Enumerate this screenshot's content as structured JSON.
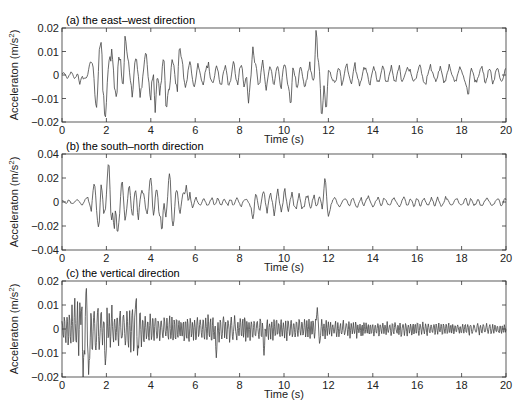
{
  "figure": {
    "width": 525,
    "height": 414,
    "line_color": "#444444",
    "axis_color": "#333333"
  },
  "chart_data": [
    {
      "type": "line",
      "title": "(a) the east–west direction",
      "xlabel": "Time (s)",
      "ylabel": "Acceleraton (m/s²)",
      "xlim": [
        0,
        20
      ],
      "ylim": [
        -0.02,
        0.02
      ],
      "xticks": [
        0,
        2,
        4,
        6,
        8,
        10,
        12,
        14,
        16,
        18,
        20
      ],
      "yticks": [
        -0.02,
        -0.01,
        0,
        0.01,
        0.02
      ],
      "ytick_labels": [
        "-0.02",
        "-0.01",
        "0",
        "0.01",
        "0.02"
      ],
      "grid": false,
      "plot_box": {
        "left": 62,
        "top": 28,
        "right": 506,
        "bottom": 122
      },
      "signal": {
        "seed": 11,
        "dt": 0.04,
        "freq": [
          1.6,
          3.2
        ],
        "envelope": [
          [
            0,
            0.0015
          ],
          [
            1.1,
            0.002
          ],
          [
            1.3,
            0.008
          ],
          [
            1.8,
            0.014
          ],
          [
            3.0,
            0.011
          ],
          [
            4.5,
            0.01
          ],
          [
            6.0,
            0.006
          ],
          [
            8.5,
            0.006
          ],
          [
            10.5,
            0.006
          ],
          [
            12.5,
            0.005
          ],
          [
            20,
            0.004
          ]
        ],
        "peaks": [
          [
            0.8,
            -0.004
          ],
          [
            1.35,
            0.005
          ],
          [
            1.55,
            -0.014
          ],
          [
            1.75,
            0.014
          ],
          [
            1.95,
            -0.018
          ],
          [
            2.85,
            0.017
          ],
          [
            4.2,
            -0.016
          ],
          [
            4.7,
            -0.015
          ],
          [
            5.3,
            0.012
          ],
          [
            8.4,
            -0.012
          ],
          [
            8.6,
            0.012
          ],
          [
            10.3,
            -0.013
          ],
          [
            11.45,
            0.0195
          ],
          [
            11.7,
            -0.018
          ],
          [
            11.9,
            -0.015
          ],
          [
            18.3,
            -0.009
          ]
        ]
      }
    },
    {
      "type": "line",
      "title": "(b) the south–north direction",
      "xlabel": "Time (s)",
      "ylabel": "Acceleraton (m/s²)",
      "xlim": [
        0,
        20
      ],
      "ylim": [
        -0.04,
        0.04
      ],
      "xticks": [
        0,
        2,
        4,
        6,
        8,
        10,
        12,
        14,
        16,
        18,
        20
      ],
      "yticks": [
        -0.04,
        -0.02,
        0,
        0.02,
        0.04
      ],
      "ytick_labels": [
        "-0.04",
        "-0.02",
        "0",
        "0.02",
        "0.04"
      ],
      "grid": false,
      "plot_box": {
        "left": 62,
        "top": 154,
        "right": 506,
        "bottom": 250
      },
      "signal": {
        "seed": 23,
        "dt": 0.04,
        "freq": [
          2.0,
          4.0
        ],
        "envelope": [
          [
            0,
            0.0015
          ],
          [
            1.0,
            0.003
          ],
          [
            1.5,
            0.012
          ],
          [
            2.2,
            0.02
          ],
          [
            3.5,
            0.016
          ],
          [
            5.5,
            0.012
          ],
          [
            6.0,
            0.004
          ],
          [
            8.5,
            0.004
          ],
          [
            9.0,
            0.012
          ],
          [
            11.5,
            0.007
          ],
          [
            12.2,
            0.005
          ],
          [
            20,
            0.004
          ]
        ],
        "peaks": [
          [
            1.45,
            0.015
          ],
          [
            1.65,
            -0.021
          ],
          [
            2.1,
            0.033
          ],
          [
            2.35,
            -0.023
          ],
          [
            2.5,
            -0.026
          ],
          [
            4.0,
            0.02
          ],
          [
            4.5,
            -0.025
          ],
          [
            4.85,
            0.024
          ],
          [
            5.0,
            -0.02
          ],
          [
            5.6,
            0.014
          ],
          [
            8.6,
            -0.014
          ],
          [
            11.85,
            0.02
          ],
          [
            12.0,
            -0.012
          ]
        ]
      }
    },
    {
      "type": "line",
      "title": "(c) the vertical direction",
      "xlabel": "Time (s)",
      "ylabel": "Acceleraton (m/s²)",
      "xlim": [
        0,
        20
      ],
      "ylim": [
        -0.02,
        0.02
      ],
      "xticks": [
        0,
        2,
        4,
        6,
        8,
        10,
        12,
        14,
        16,
        18,
        20
      ],
      "yticks": [
        -0.02,
        -0.01,
        0,
        0.01,
        0.02
      ],
      "ytick_labels": [
        "-0.02",
        "-0.01",
        "0",
        "0.01",
        "0.02"
      ],
      "grid": false,
      "plot_box": {
        "left": 62,
        "top": 281,
        "right": 506,
        "bottom": 377
      },
      "signal": {
        "seed": 37,
        "dt": 0.025,
        "freq": [
          6.0,
          11.0
        ],
        "envelope": [
          [
            0,
            0.006
          ],
          [
            0.8,
            0.014
          ],
          [
            1.3,
            0.012
          ],
          [
            2.5,
            0.009
          ],
          [
            3.3,
            0.01
          ],
          [
            4.0,
            0.006
          ],
          [
            6.0,
            0.006
          ],
          [
            7.0,
            0.007
          ],
          [
            9.0,
            0.005
          ],
          [
            11.5,
            0.005
          ],
          [
            12.0,
            0.004
          ],
          [
            20,
            0.0025
          ]
        ],
        "peaks": [
          [
            0.9,
            0.017
          ],
          [
            0.95,
            -0.02
          ],
          [
            1.1,
            0.017
          ],
          [
            1.2,
            -0.019
          ],
          [
            1.95,
            -0.015
          ],
          [
            3.35,
            0.019
          ],
          [
            3.4,
            -0.011
          ],
          [
            6.95,
            -0.012
          ],
          [
            9.1,
            -0.011
          ],
          [
            11.5,
            0.009
          ],
          [
            11.6,
            -0.006
          ]
        ]
      }
    }
  ]
}
